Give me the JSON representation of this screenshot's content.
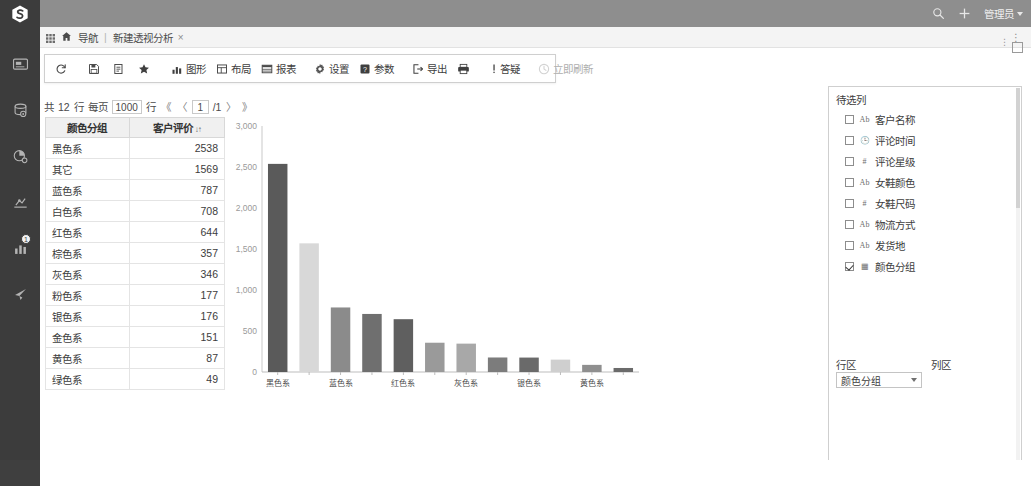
{
  "app": {
    "logo_name": "smartbi-logo",
    "header": {
      "search_icon": "search-icon",
      "add_icon": "plus-icon",
      "user_label": "管理员"
    }
  },
  "sidebar": {
    "items": [
      {
        "icon": "dashboard-icon",
        "name": "sidebar-item-dashboard",
        "badge": ""
      },
      {
        "icon": "database-icon",
        "name": "sidebar-item-datasource",
        "badge": ""
      },
      {
        "icon": "pie-chart-icon",
        "name": "sidebar-item-dataset",
        "badge": ""
      },
      {
        "icon": "mining-icon",
        "name": "sidebar-item-mining",
        "badge": ""
      },
      {
        "icon": "bar-chart-icon",
        "name": "sidebar-item-analysis",
        "badge": "1"
      },
      {
        "icon": "send-icon",
        "name": "sidebar-item-share",
        "badge": ""
      }
    ]
  },
  "tabbar": {
    "grid_icon": "grid-icon",
    "home_icon": "home-icon",
    "nav_label": "导航",
    "separator": "|",
    "tabs": [
      {
        "label": "新建透视分析",
        "close": "×"
      }
    ],
    "overflow": "⋮"
  },
  "toolbar": {
    "buttons": [
      {
        "label": "",
        "icon": "refresh-icon",
        "name": "refresh-button",
        "disabled": false
      },
      {
        "label": "",
        "icon": "save-icon",
        "name": "save-button",
        "disabled": false
      },
      {
        "label": "",
        "icon": "save-as-icon",
        "name": "save-as-button",
        "disabled": false
      },
      {
        "label": "",
        "icon": "star-icon",
        "name": "favorite-button",
        "disabled": false
      },
      {
        "label": "图形",
        "icon": "chart-icon",
        "name": "chart-button",
        "disabled": false
      },
      {
        "label": "布局",
        "icon": "layout-icon",
        "name": "layout-button",
        "disabled": false
      },
      {
        "label": "报表",
        "icon": "report-icon",
        "name": "report-button",
        "disabled": false
      },
      {
        "label": "设置",
        "icon": "gear-icon",
        "name": "settings-button",
        "disabled": false
      },
      {
        "label": "参数",
        "icon": "param-icon",
        "name": "parameter-button",
        "disabled": false
      },
      {
        "label": "导出",
        "icon": "export-icon",
        "name": "export-button",
        "disabled": false
      },
      {
        "label": "",
        "icon": "print-icon",
        "name": "print-button",
        "disabled": false
      },
      {
        "label": "答疑",
        "icon": "help-icon",
        "name": "help-button",
        "disabled": false
      },
      {
        "label": "立即刷新",
        "icon": "clock-icon",
        "name": "refresh-now-button",
        "disabled": true
      }
    ]
  },
  "pager": {
    "total_prefix": "共",
    "total_rows": "12",
    "rows_unit": "行",
    "per_page_label": "每页",
    "per_page_value": "1000",
    "per_page_unit": "行",
    "first": "《",
    "prev": "〈",
    "current_page": "1",
    "page_total": "/1",
    "next": "〉",
    "last": "》"
  },
  "table": {
    "columns": [
      "颜色分组",
      "客户评价"
    ],
    "sort_indicator": "↓↑",
    "rows": [
      {
        "group": "黑色系",
        "value": "2538"
      },
      {
        "group": "其它",
        "value": "1569"
      },
      {
        "group": "蓝色系",
        "value": "787"
      },
      {
        "group": "白色系",
        "value": "708"
      },
      {
        "group": "红色系",
        "value": "644"
      },
      {
        "group": "棕色系",
        "value": "357"
      },
      {
        "group": "灰色系",
        "value": "346"
      },
      {
        "group": "粉色系",
        "value": "177"
      },
      {
        "group": "银色系",
        "value": "176"
      },
      {
        "group": "金色系",
        "value": "151"
      },
      {
        "group": "黄色系",
        "value": "87"
      },
      {
        "group": "绿色系",
        "value": "49"
      }
    ]
  },
  "chart_data": {
    "type": "bar",
    "title": "",
    "xlabel": "",
    "ylabel": "",
    "categories": [
      "黑色系",
      "其它",
      "蓝色系",
      "白色系",
      "红色系",
      "棕色系",
      "灰色系",
      "粉色系",
      "银色系",
      "金色系",
      "黄色系",
      "绿色系"
    ],
    "values": [
      2538,
      1569,
      787,
      708,
      644,
      357,
      346,
      177,
      176,
      151,
      87,
      49
    ],
    "bar_colors": [
      "#5a5a5a",
      "#d8d8d8",
      "#8b8b8b",
      "#6f6f6f",
      "#5f5f5f",
      "#9a9a9a",
      "#a8a8a8",
      "#7c7c7c",
      "#6a6a6a",
      "#cfcfcf",
      "#8f8f8f",
      "#6b6b6b"
    ],
    "visible_x_ticks": [
      "黑色系",
      "蓝色系",
      "红色系",
      "灰色系",
      "银色系",
      "黄色系"
    ],
    "ytick_labels": [
      "0",
      "500",
      "1,000",
      "1,500",
      "2,000",
      "2,500",
      "3,000"
    ],
    "ylim": [
      0,
      3000
    ],
    "grid": false,
    "legend": "none"
  },
  "right_panel": {
    "title": "待选列",
    "fields": [
      {
        "label": "客户名称",
        "type": "Ab",
        "checked": false
      },
      {
        "label": "评论时间",
        "type": "🕒",
        "checked": false
      },
      {
        "label": "评论星级",
        "type": "#",
        "checked": false
      },
      {
        "label": "女鞋颜色",
        "type": "Ab",
        "checked": false
      },
      {
        "label": "女鞋尺码",
        "type": "#",
        "checked": false
      },
      {
        "label": "物流方式",
        "type": "Ab",
        "checked": false
      },
      {
        "label": "发货地",
        "type": "Ab",
        "checked": false
      },
      {
        "label": "颜色分组",
        "type": "▦",
        "checked": true
      }
    ],
    "row_area_label": "行区",
    "row_area_value": "颜色分组",
    "col_area_label": "列区",
    "measure_label": "度量",
    "measure_value": "客户评价(计数)"
  }
}
